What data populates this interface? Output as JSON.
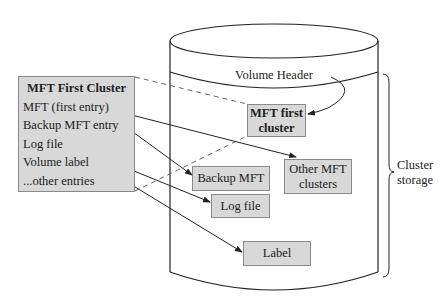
{
  "panel": {
    "title": "MFT First Cluster",
    "entries": [
      "MFT (first entry)",
      "Backup MFT entry",
      "Log file",
      "Volume label",
      "...other entries"
    ]
  },
  "volume": {
    "header_label": "Volume Header",
    "boxes": {
      "mft_first_cluster": [
        "MFT first",
        "cluster"
      ],
      "backup_mft": "Backup MFT",
      "log_file": "Log file",
      "other_mft_clusters": [
        "Other MFT",
        "clusters"
      ],
      "label": "Label"
    }
  },
  "brace": {
    "label": [
      "Cluster",
      "storage"
    ]
  },
  "colors": {
    "box_fill": "#d8d8d8",
    "box_border": "#8a8a8a",
    "line": "#222222"
  }
}
